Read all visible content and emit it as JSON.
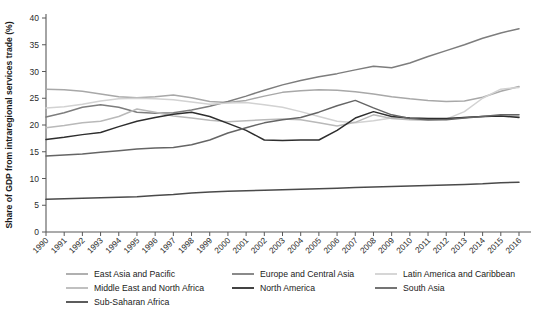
{
  "chart_data": {
    "type": "line",
    "title": "",
    "xlabel": "",
    "ylabel": "Share of GDP from intraregional services trade (%)",
    "ylim": [
      0,
      40
    ],
    "ytick_step": 5,
    "yticks": [
      0,
      5,
      10,
      15,
      20,
      25,
      30,
      35,
      40
    ],
    "grid": false,
    "legend_position": "below",
    "x": [
      1990,
      1991,
      1992,
      1993,
      1994,
      1995,
      1996,
      1997,
      1998,
      1999,
      2000,
      2001,
      2002,
      2003,
      2004,
      2005,
      2006,
      2007,
      2008,
      2009,
      2010,
      2011,
      2012,
      2013,
      2014,
      2015,
      2016
    ],
    "categories": [
      "1990",
      "1991",
      "1992",
      "1993",
      "1994",
      "1995",
      "1996",
      "1997",
      "1998",
      "1999",
      "2000",
      "2001",
      "2002",
      "2003",
      "2004",
      "2005",
      "2006",
      "2007",
      "2008",
      "2009",
      "2010",
      "2011",
      "2012",
      "2013",
      "2014",
      "2015",
      "2016"
    ],
    "series": [
      {
        "name": "East Asia and Pacific",
        "color": "#a8a8a8",
        "values": [
          26.7,
          26.6,
          26.3,
          25.8,
          25.3,
          25.1,
          25.3,
          25.6,
          25.1,
          24.4,
          24.2,
          24.6,
          25.4,
          26.1,
          26.4,
          26.6,
          26.5,
          26.2,
          25.8,
          25.3,
          24.9,
          24.6,
          24.4,
          24.5,
          25.2,
          26.3,
          27.2
        ]
      },
      {
        "name": "Europe and Central Asia",
        "color": "#7d7d7d",
        "values": [
          21.5,
          22.3,
          23.3,
          23.8,
          23.3,
          22.4,
          22.2,
          22.3,
          22.8,
          23.5,
          24.4,
          25.4,
          26.5,
          27.5,
          28.3,
          29.0,
          29.6,
          30.3,
          31.0,
          30.7,
          31.6,
          32.8,
          33.9,
          35.0,
          36.2,
          37.2,
          38.0
        ]
      },
      {
        "name": "Latin America and Caribbean",
        "color": "#d2d2d2",
        "values": [
          23.2,
          23.4,
          23.9,
          24.5,
          24.9,
          25.0,
          24.9,
          24.7,
          24.3,
          23.9,
          24.1,
          24.2,
          23.8,
          23.3,
          22.5,
          21.6,
          20.7,
          20.4,
          20.8,
          21.3,
          21.3,
          21.2,
          21.1,
          22.5,
          25.0,
          26.7,
          27.0
        ]
      },
      {
        "name": "Middle East and North Africa",
        "color": "#b9b9b9",
        "values": [
          19.5,
          19.9,
          20.4,
          20.7,
          21.6,
          23.0,
          22.4,
          21.7,
          21.3,
          20.9,
          20.6,
          20.8,
          21.0,
          21.1,
          21.0,
          20.4,
          19.8,
          20.5,
          21.9,
          21.2,
          21.0,
          20.9,
          21.1,
          21.4,
          21.6,
          21.7,
          21.6
        ]
      },
      {
        "name": "North America",
        "color": "#2e2e2e",
        "values": [
          17.3,
          17.7,
          18.2,
          18.6,
          19.7,
          20.7,
          21.4,
          22.0,
          22.4,
          21.6,
          20.3,
          19.0,
          17.2,
          17.1,
          17.2,
          17.2,
          19.0,
          21.3,
          22.5,
          21.6,
          21.3,
          21.2,
          21.2,
          21.4,
          21.6,
          21.7,
          21.4
        ]
      },
      {
        "name": "South Asia",
        "color": "#656565",
        "values": [
          14.2,
          14.4,
          14.6,
          14.9,
          15.2,
          15.5,
          15.7,
          15.8,
          16.3,
          17.2,
          18.5,
          19.5,
          20.4,
          21.0,
          21.4,
          22.4,
          23.6,
          24.6,
          23.2,
          21.9,
          21.2,
          21.0,
          21.0,
          21.3,
          21.6,
          21.9,
          21.9
        ]
      },
      {
        "name": "Sub-Saharan Africa",
        "color": "#4a4a4a",
        "values": [
          6.1,
          6.2,
          6.3,
          6.4,
          6.5,
          6.6,
          6.8,
          7.0,
          7.3,
          7.5,
          7.6,
          7.7,
          7.8,
          7.9,
          8.0,
          8.1,
          8.2,
          8.3,
          8.4,
          8.5,
          8.6,
          8.7,
          8.8,
          8.9,
          9.0,
          9.2,
          9.3
        ]
      }
    ],
    "legend": [
      {
        "label": "East Asia and Pacific",
        "color": "#a8a8a8"
      },
      {
        "label": "Europe and Central Asia",
        "color": "#7d7d7d"
      },
      {
        "label": "Latin America and Caribbean",
        "color": "#d2d2d2"
      },
      {
        "label": "Middle East and North Africa",
        "color": "#b9b9b9"
      },
      {
        "label": "North America",
        "color": "#2e2e2e"
      },
      {
        "label": "South Asia",
        "color": "#656565"
      },
      {
        "label": "Sub-Saharan Africa",
        "color": "#4a4a4a"
      }
    ]
  }
}
